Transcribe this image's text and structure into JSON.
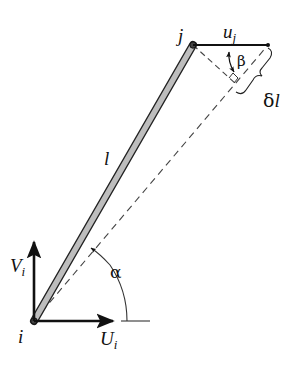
{
  "diagram": {
    "type": "truss-member-displacement",
    "colors": {
      "ink": "#111111",
      "member_fill": "#bdbdbd",
      "dashed": "#444444",
      "background": "#ffffff"
    },
    "nodes": {
      "i": {
        "label": "i",
        "x": 34,
        "y": 321
      },
      "j": {
        "label": "j",
        "x": 193,
        "y": 45
      }
    },
    "member": {
      "label": "l"
    },
    "labels": {
      "node_i": "i",
      "node_j": "j",
      "member_length": "l",
      "vertical_force": "V",
      "vertical_force_sub": "i",
      "horizontal_force": "U",
      "horizontal_force_sub": "i",
      "displacement": "u",
      "displacement_sub": "j",
      "angle_alpha": "α",
      "angle_beta": "β",
      "elongation_delta": "δ",
      "elongation_l": "l"
    }
  }
}
